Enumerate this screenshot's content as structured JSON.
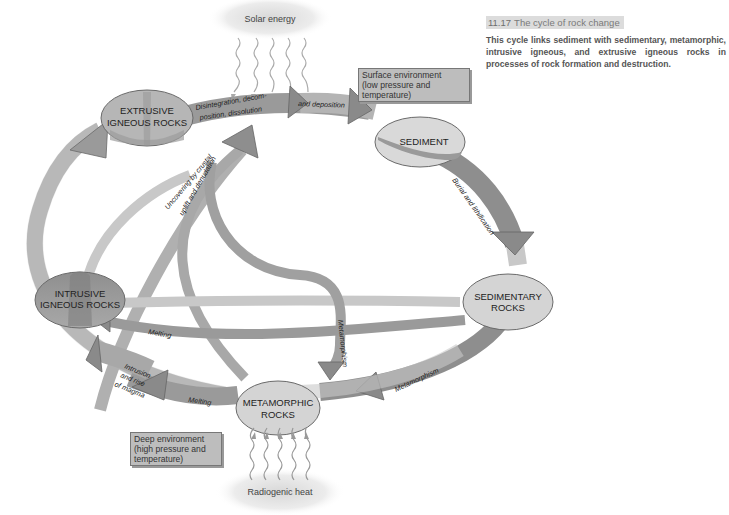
{
  "figure": {
    "number": "11.17",
    "title": "The cycle of rock change",
    "description": "This cycle links sediment with sedimentary, metamorphic, intrusive igneous, and extrusive igneous rocks in processes of rock formation and destruction."
  },
  "environments": {
    "surface": "Surface environment (low pressure and temperature)",
    "surface_lines": [
      "Surface environment",
      "(low pressure and",
      "temperature)"
    ],
    "deep": "Deep environment (high pressure and temperature)",
    "deep_lines": [
      "Deep environment",
      "(high pressure and",
      "temperature)"
    ]
  },
  "energy_sources": {
    "top": "Solar energy",
    "bottom": "Radiogenic heat"
  },
  "nodes": {
    "extrusive": [
      "EXTRUSIVE",
      "IGNEOUS ROCKS"
    ],
    "sediment": [
      "SEDIMENT"
    ],
    "sedimentary": [
      "SEDIMENTARY",
      "ROCKS"
    ],
    "metamorphic": [
      "METAMORPHIC",
      "ROCKS"
    ],
    "intrusive": [
      "INTRUSIVE",
      "IGNEOUS ROCKS"
    ]
  },
  "processes": {
    "weathering": [
      "Disintegration, decom-",
      "position, dissolution"
    ],
    "deposition": "and deposition",
    "burial": "Burial and lithification",
    "metamorphism_sed": "Metamorphism",
    "metamorphism_intr": "Metamorphism",
    "melting_meta": "Melting",
    "melting_sed": "Melting",
    "intrusion": [
      "Intrusion",
      "and rise",
      "of magma"
    ],
    "uncovering": [
      "Uncovering by crustal",
      "uplift and denudation"
    ]
  },
  "colors": {
    "band_light": "#c9c9c9",
    "band_dark": "#8e8e8e",
    "node_fill": "#d6d6d6",
    "node_dark": "#9a9a9a",
    "outline": "#6a6a6a",
    "text": "#222222"
  }
}
